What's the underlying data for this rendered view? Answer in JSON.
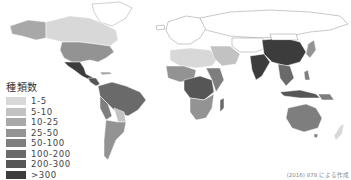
{
  "map": {
    "title": "World map of species count by country",
    "legend": {
      "title": "種類数",
      "classes": [
        {
          "label": "1-5",
          "color": "#d8d8d8"
        },
        {
          "label": "5-10",
          "color": "#c2c2c2"
        },
        {
          "label": "10-25",
          "color": "#a8a8a8"
        },
        {
          "label": "25-50",
          "color": "#939393"
        },
        {
          "label": "50-100",
          "color": "#7e7e7e"
        },
        {
          "label": "100-200",
          "color": "#6a6a6a"
        },
        {
          "label": "200-300",
          "color": "#565656"
        },
        {
          "label": ">300",
          "color": "#3c3c3c"
        }
      ]
    },
    "no_data_color": "#ffffff",
    "credit": "(2016) 878 による作成"
  }
}
